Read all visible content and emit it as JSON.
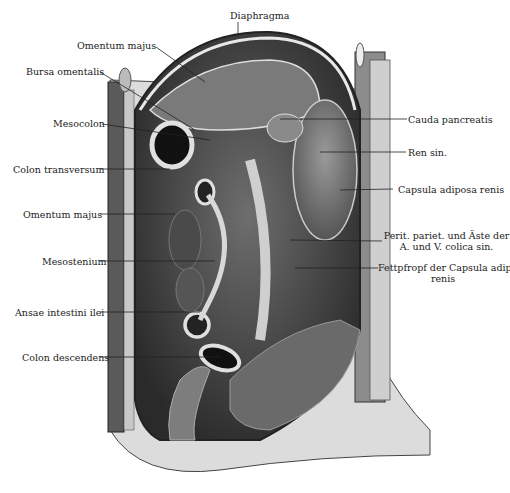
{
  "figure": {
    "labels": {
      "diaphragma": "Diaphragma",
      "omentum_majus_top": "Omentum majus",
      "bursa_omentalis": "Bursa omentalis",
      "mesocolon": "Mesocolon",
      "colon_transversum": "Colon transversum",
      "omentum_majus_mid": "Omentum majus",
      "mesostenium": "Mesostenium",
      "ansae_intestini_ilei": "Ansae intestini ilei",
      "colon_descendens": "Colon descendens",
      "cauda_pancreatis": "Cauda pancreatis",
      "ren_sin": "Ren sin.",
      "capsula_adiposa_renis": "Capsula adiposa renis",
      "perit_line1": "Perit. pariet. und Äste der",
      "perit_line2": "A. und V. colica sin.",
      "fettpfropf_line1": "Fettpfropf der Capsula adip.",
      "fettpfropf_line2": "renis"
    }
  }
}
